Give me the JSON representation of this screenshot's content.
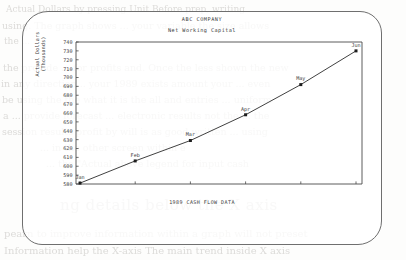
{
  "page": {
    "media": "scanned-manual-page",
    "frame_shape": "rounded-rectangle"
  },
  "bleed_through_text": [
    "Actual Dollars by pressing Unit Before prep, writing",
    "using. The graph shows ... your variable the size allows",
    "the ...",
    "the provide ... for profits and. Once the less shown the  new",
    "in any direction... your 1989 exists amount your ... even",
    "be using the  the what  it is the all and entries ... uniform",
    "a ... provide forecast ... electronic results not   the  ... the",
    "session results profit by will  is  as  good  written  ... using",
    "... in  the   other   screen   within   e",
    "... the \"Actual above legend for input cash",
    "ng details below the X axis",
    "pearn  to improve information  within  a graph  will not  preset",
    "Information  help  the  X-axis  The  main  trend  inside  X  axis"
  ],
  "chart_data": {
    "type": "line",
    "title": "ABC COMPANY",
    "subtitle": "Net Working Capital",
    "xlabel": "1989 CASH FLOW DATA",
    "ylabel": "Actual Dollars",
    "ylabel2": "(Thousands)",
    "categories": [
      "Jan",
      "Feb",
      "Mar",
      "Apr",
      "May",
      "Jun"
    ],
    "values": [
      581,
      606,
      629,
      658,
      692,
      730
    ],
    "point_labels": [
      "Jan",
      "Feb",
      "Mar",
      "Apr",
      "May",
      "Jun"
    ],
    "ylim": [
      580,
      740
    ],
    "ytick_step": 10,
    "yticks": [
      740,
      730,
      720,
      710,
      700,
      690,
      680,
      670,
      660,
      650,
      640,
      630,
      620,
      610,
      600,
      590,
      580
    ],
    "grid": false,
    "legend": "none",
    "marker": "square",
    "line_color": "#2b2b2b",
    "axis_color": "#4a4a4a"
  }
}
